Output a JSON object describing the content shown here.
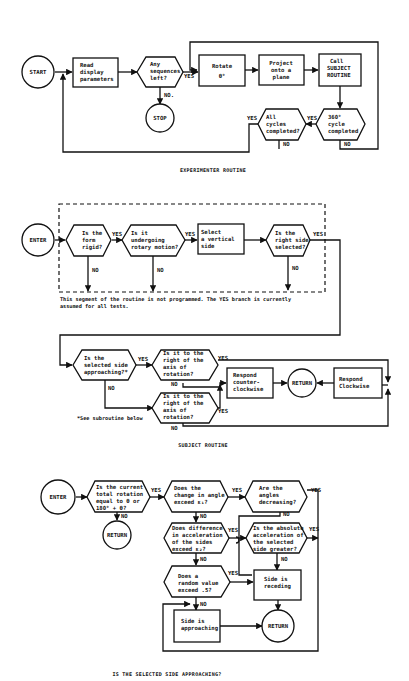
{
  "experimenter": {
    "caption": "EXPERIMENTER ROUTINE",
    "start": "START",
    "read": [
      "Read",
      "display",
      "parameters"
    ],
    "any_seq": [
      "Any",
      "sequences",
      "left?"
    ],
    "stop": "STOP",
    "rotate": [
      "Rotate",
      "θ°"
    ],
    "project": [
      "Project",
      "onto a",
      "plane"
    ],
    "call": [
      "Call",
      "SUBJECT",
      "ROUTINE"
    ],
    "cycle360": [
      "360°",
      "cycle",
      "completed"
    ],
    "all_cycles": [
      "All",
      "cycles",
      "completed?"
    ],
    "yes": "YES",
    "no": "NO",
    "no_dot": "NO."
  },
  "subject": {
    "caption": "SUBJECT ROUTINE",
    "enter": "ENTER",
    "rigid": [
      "Is the",
      "form",
      "rigid?"
    ],
    "rotary": [
      "Is it",
      "undergoing",
      "rotary motion?"
    ],
    "select": [
      "Select",
      "a vertical",
      "side"
    ],
    "right_side": [
      "Is the",
      "right side",
      "selected?"
    ],
    "note": [
      "This segment of the routine is not programmed.  The YES branch is currently",
      "assumed for all tests."
    ],
    "approaching": [
      "Is the",
      "selected side",
      "approaching?*"
    ],
    "right_axis_1": [
      "Is it to the",
      "right of the",
      "axis of",
      "rotation?"
    ],
    "right_axis_2": [
      "Is it to the",
      "right of the",
      "axis of",
      "rotation?"
    ],
    "ccw": [
      "Respond",
      "counter-",
      "clockwise"
    ],
    "return": "RETURN",
    "cw": [
      "Respond",
      "Clockwise"
    ],
    "footnote": "*See subroutine below",
    "yes": "YES",
    "no": "NO"
  },
  "approach": {
    "caption": "IS THE SELECTED SIDE APPROACHING?",
    "enter": "ENTER",
    "total_rot": [
      "Is the current",
      "total rotation",
      "equal to θ or",
      "180° + θ?"
    ],
    "return1": "RETURN",
    "angle_change": [
      "Does the",
      "change in angle",
      "exceed ε₁?"
    ],
    "decreasing": [
      "Are the",
      "angles",
      "decreasing?"
    ],
    "accel_diff": [
      "Does difference",
      "in acceleration",
      "of the sides",
      "exceed ε₂?"
    ],
    "abs_accel": [
      "Is the absolute",
      "acceleration of",
      "the selected",
      "side greater?"
    ],
    "random": [
      "Does a",
      "random value",
      "exceed .5?"
    ],
    "receding": [
      "Side is",
      "receding"
    ],
    "approaching": [
      "Side is",
      "approaching"
    ],
    "return2": "RETURN",
    "yes": "YES",
    "no": "NO"
  }
}
